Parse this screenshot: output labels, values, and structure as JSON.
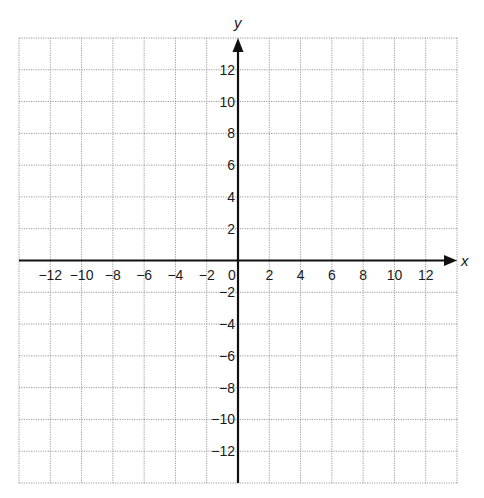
{
  "chart_data": {
    "type": "scatter",
    "title": "",
    "xlabel": "x",
    "ylabel": "y",
    "xlim": [
      -14,
      14
    ],
    "ylim": [
      -14,
      14
    ],
    "grid": true,
    "grid_step": 2,
    "x_ticks": [
      -12,
      -10,
      -8,
      -6,
      -4,
      -2,
      0,
      2,
      4,
      6,
      8,
      10,
      12
    ],
    "y_ticks": [
      -12,
      -10,
      -8,
      -6,
      -4,
      -2,
      2,
      4,
      6,
      8,
      10,
      12
    ],
    "x_tick_labels": [
      "−12",
      "−10",
      "−8",
      "−6",
      "−4",
      "−2",
      "0",
      "2",
      "4",
      "6",
      "8",
      "10",
      "12"
    ],
    "y_tick_labels": [
      "−12",
      "−10",
      "−8",
      "−6",
      "−4",
      "−2",
      "2",
      "4",
      "6",
      "8",
      "10",
      "12"
    ],
    "series": [],
    "legend": null
  },
  "colors": {
    "axis": "#111111",
    "grid": "#9a9a9a",
    "text": "#1a1a1a"
  }
}
